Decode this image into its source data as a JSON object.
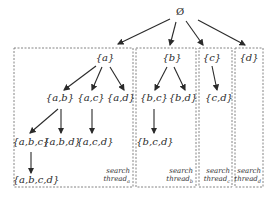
{
  "diagram": {
    "root": "Ø",
    "nodes": [
      {
        "id": "a",
        "label": "{a}",
        "x": 105,
        "y": 52
      },
      {
        "id": "b",
        "label": "{b}",
        "x": 172,
        "y": 52
      },
      {
        "id": "c",
        "label": "{c}",
        "x": 212,
        "y": 52
      },
      {
        "id": "d",
        "label": "{d}",
        "x": 249,
        "y": 52
      },
      {
        "id": "ab",
        "label": "{a,b}",
        "x": 60,
        "y": 91
      },
      {
        "id": "ac",
        "label": "{a,c}",
        "x": 91,
        "y": 91
      },
      {
        "id": "ad",
        "label": "{a,d}",
        "x": 121,
        "y": 91
      },
      {
        "id": "bc",
        "label": "{b,c}",
        "x": 154,
        "y": 91
      },
      {
        "id": "bd",
        "label": "{b,d}",
        "x": 183,
        "y": 91
      },
      {
        "id": "cd",
        "label": "{c,d}",
        "x": 219,
        "y": 91
      },
      {
        "id": "abc",
        "label": "{a,b,c}",
        "x": 31,
        "y": 134
      },
      {
        "id": "abd",
        "label": "{a,b,d}",
        "x": 62,
        "y": 134
      },
      {
        "id": "acd",
        "label": "{a,c,d}",
        "x": 95,
        "y": 134
      },
      {
        "id": "bcd",
        "label": "{b,c,d}",
        "x": 155,
        "y": 134
      },
      {
        "id": "abcd",
        "label": "{a,b,c,d}",
        "x": 33,
        "y": 175
      }
    ],
    "edges": [
      [
        "root",
        "a"
      ],
      [
        "root",
        "b"
      ],
      [
        "root",
        "c"
      ],
      [
        "root",
        "d"
      ],
      [
        "a",
        "ab"
      ],
      [
        "a",
        "ac"
      ],
      [
        "a",
        "ad"
      ],
      [
        "b",
        "bc"
      ],
      [
        "b",
        "bd"
      ],
      [
        "c",
        "cd"
      ],
      [
        "ab",
        "abc"
      ],
      [
        "ab",
        "abd"
      ],
      [
        "ac",
        "acd"
      ],
      [
        "bc",
        "bcd"
      ],
      [
        "abc",
        "abcd"
      ]
    ],
    "threads": [
      {
        "label": "search",
        "sub_label": "thread",
        "subscript": "a"
      },
      {
        "label": "search",
        "sub_label": "thread",
        "subscript": "b"
      },
      {
        "label": "search",
        "sub_label": "thread",
        "subscript": "c"
      },
      {
        "label": "search",
        "sub_label": "thread",
        "subscript": "d"
      }
    ]
  }
}
